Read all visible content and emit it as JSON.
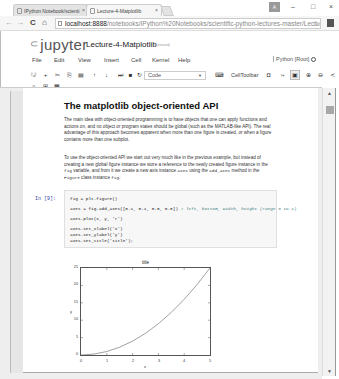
{
  "browser": {
    "tabs": [
      {
        "label": "IPython Notebook/scienti",
        "active": false,
        "close": "×"
      },
      {
        "label": "Lecture-4-Matplotlib",
        "active": true,
        "close": "×"
      }
    ],
    "window_controls": {
      "user": "A",
      "minimize": "–",
      "maximize": "□",
      "close": "×"
    },
    "nav": {
      "back": "←",
      "forward": "→",
      "reload": "C",
      "home": "⌂"
    },
    "url_host": "localhost:8888",
    "url_path": "/notebooks/IPython%20Notebooks/scientific-python-lectures-master/Lectur",
    "star": "☆"
  },
  "jupyter": {
    "logo": "jupyter",
    "notebook_name": "Lecture-4-Matplotlib",
    "saved_status": "(autosaved)",
    "menu": [
      "File",
      "Edit",
      "View",
      "Insert",
      "Cell",
      "Kernel",
      "Help"
    ],
    "kernel": "Python [Root]",
    "toolbar": {
      "cell_type": "Code",
      "cell_toolbar": "CellToolbar"
    }
  },
  "notebook": {
    "markdown": {
      "heading": "The matplotlib object-oriented API",
      "p1": "The main idea with object-oriented programming is to have objects that one can apply functions and actions on, and no object or program states should be global (such as the MATLAB-like API). The real advantage of this approach becomes apparent when more than one figure is created, or when a figure contains more than one subplot.",
      "p2_a": "To use the object-oriented API we start out very much like in the previous example, but instead of creating a new global figure instance we store a reference to the newly created figure instance in the ",
      "p2_code1": "fig",
      "p2_b": " variable, and from it we create a new axis instance ",
      "p2_code2": "axes",
      "p2_c": " using the ",
      "p2_code3": "add_axes",
      "p2_d": " method in the ",
      "p2_code4": "Figure",
      "p2_e": " class instance ",
      "p2_code5": "fig",
      "p2_f": ":"
    },
    "code_cell": {
      "prompt": "In [9]:",
      "lines": [
        "fig = plt.figure()",
        "axes = fig.add_axes([0.1, 0.1, 0.8, 0.8]) ",
        "axes.plot(x, y, 'r')",
        "axes.set_xlabel('x')",
        "axes.set_ylabel('y')",
        "axes.set_title('title');"
      ],
      "comment": "# left, bottom, width, height (range 0 to 1)"
    }
  },
  "chart_data": {
    "type": "line",
    "title": "title",
    "xlabel": "x",
    "ylabel": "y",
    "x": [
      0,
      0.5,
      1,
      1.5,
      2,
      2.5,
      3,
      3.5,
      4,
      4.5,
      5
    ],
    "series": [
      {
        "name": "y = x**2",
        "color": "#888888",
        "values": [
          0,
          0.25,
          1,
          2.25,
          4,
          6.25,
          9,
          12.25,
          16,
          20.25,
          25
        ]
      }
    ],
    "xticks": [
      "0",
      "1",
      "2",
      "3",
      "4",
      "5"
    ],
    "yticks": [
      "0",
      "5",
      "10",
      "15",
      "20",
      "25"
    ],
    "xlim": [
      0,
      5
    ],
    "ylim": [
      0,
      25
    ],
    "grid": false
  }
}
